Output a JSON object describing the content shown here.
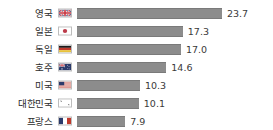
{
  "chart_data": {
    "type": "bar",
    "orientation": "horizontal",
    "title": "",
    "subtitle": "",
    "xlabel": "",
    "ylabel": "",
    "grid": false,
    "legend": "none",
    "xlim": [
      0,
      23.7
    ],
    "categories": [
      "영국",
      "일본",
      "독일",
      "호주",
      "미국",
      "대한민국",
      "프랑스"
    ],
    "values": [
      23.7,
      17.3,
      17.0,
      14.6,
      10.3,
      10.1,
      7.9
    ],
    "value_labels": [
      "23.7",
      "17.3",
      "17.0",
      "14.6",
      "10.3",
      "10.1",
      "7.9"
    ],
    "icons": [
      "flag-united-kingdom",
      "flag-japan",
      "flag-germany",
      "flag-australia",
      "flag-united-states",
      "flag-south-korea",
      "flag-france"
    ],
    "bar_color": "#8c8c8c",
    "label_color": "#2b2b2b",
    "value_color": "#3a3a3a",
    "background": "#ffffff"
  },
  "rows": [
    {
      "label": "영국",
      "value": "23.7",
      "icon": "flag-united-kingdom"
    },
    {
      "label": "일본",
      "value": "17.3",
      "icon": "flag-japan"
    },
    {
      "label": "독일",
      "value": "17.0",
      "icon": "flag-germany"
    },
    {
      "label": "호주",
      "value": "14.6",
      "icon": "flag-australia"
    },
    {
      "label": "미국",
      "value": "10.3",
      "icon": "flag-united-states"
    },
    {
      "label": "대한민국",
      "value": "10.1",
      "icon": "flag-south-korea"
    },
    {
      "label": "프랑스",
      "value": "7.9",
      "icon": "flag-france"
    }
  ]
}
